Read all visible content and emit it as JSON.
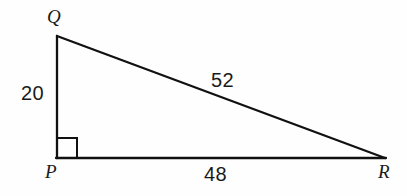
{
  "figure": {
    "kind": "geometry-diagram",
    "shape": "right-triangle",
    "background_color": "#fefefe",
    "stroke_color": "#111111",
    "text_color": "#1a1a1a"
  },
  "vertices": [
    {
      "id": "Q",
      "label": "Q",
      "x": 57,
      "y": 36,
      "name": "vertex-label-q"
    },
    {
      "id": "P",
      "label": "P",
      "x": 57,
      "y": 158,
      "name": "vertex-label-p"
    },
    {
      "id": "R",
      "label": "R",
      "x": 385,
      "y": 158,
      "name": "vertex-label-r"
    }
  ],
  "sides": [
    {
      "id": "PQ",
      "label": "20",
      "from": "P",
      "to": "Q",
      "role": "leg",
      "position": "left"
    },
    {
      "id": "QR",
      "label": "52",
      "from": "Q",
      "to": "R",
      "role": "hypotenuse",
      "position": "upper-right"
    },
    {
      "id": "PR",
      "label": "48",
      "from": "P",
      "to": "R",
      "role": "leg",
      "position": "bottom"
    }
  ],
  "right_angle": {
    "at_vertex": "P",
    "marker": "square",
    "size": 20,
    "label": ""
  },
  "geometry": {
    "path": "M 57 36 L 57 158 L 385 158 Z",
    "leg_vertical": {
      "x1": 57,
      "y1": 36,
      "x2": 57,
      "y2": 158
    },
    "leg_horizontal": {
      "x1": 57,
      "y1": 158,
      "x2": 385,
      "y2": 158
    },
    "hypotenuse": {
      "x1": 57,
      "y1": 36,
      "x2": 385,
      "y2": 158
    },
    "right_angle_square": {
      "x": 57,
      "y": 138,
      "width": 20,
      "height": 20
    },
    "stroke_width": 2.2
  }
}
